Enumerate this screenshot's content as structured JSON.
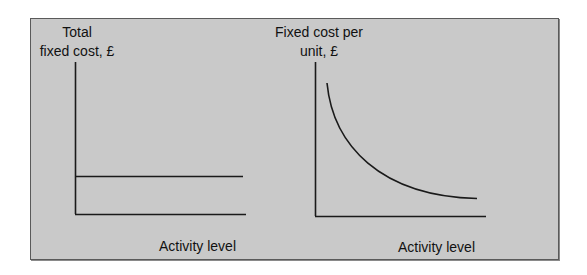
{
  "colors": {
    "background": "#ffffff",
    "panel_fill": "#c9c9c9",
    "panel_border": "#5a5a5a",
    "line": "#1a1a1a",
    "text": "#111111"
  },
  "left_chart": {
    "y_label_line1": "Total",
    "y_label_line2": "fixed cost, £",
    "x_label": "Activity level",
    "description": "Horizontal line: total fixed cost constant as activity level changes"
  },
  "right_chart": {
    "y_label_line1": "Fixed cost per",
    "y_label_line2": "unit, £",
    "x_label": "Activity level",
    "description": "Downward-sloping curve: fixed cost per unit falls as activity level rises"
  }
}
